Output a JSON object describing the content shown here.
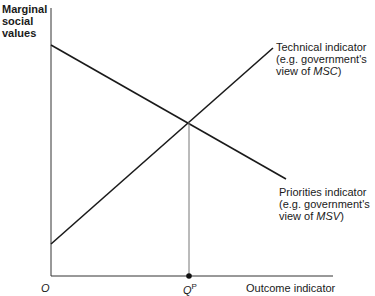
{
  "diagram": {
    "y_axis_label_lines": [
      "Marginal",
      "social",
      "values"
    ],
    "x_axis_label": "Outcome indicator",
    "origin_label": "O",
    "equilibrium_label": "Q",
    "equilibrium_superscript": "P",
    "technical_indicator": {
      "line1": "Technical indicator",
      "line2": "(e.g. government's",
      "line3_prefix": "view of ",
      "line3_italic": "MSC",
      "line3_suffix": ")"
    },
    "priorities_indicator": {
      "line1": "Priorities indicator",
      "line2": "(e.g. government's",
      "line3_prefix": "view of ",
      "line3_italic": "MSV",
      "line3_suffix": ")"
    },
    "colors": {
      "line": "#1a1a1a",
      "drop_line": "#555555"
    }
  }
}
